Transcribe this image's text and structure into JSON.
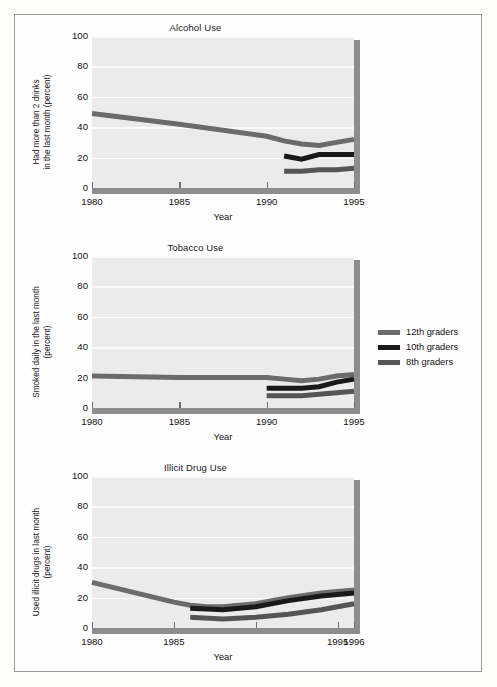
{
  "figure": {
    "xlabel": "Year",
    "legend": {
      "position": "right-middle",
      "entries": [
        {
          "label": "12th graders",
          "color": "#6b6b6b"
        },
        {
          "label": "10th graders",
          "color": "#191919"
        },
        {
          "label": "8th graders",
          "color": "#555555"
        }
      ]
    }
  },
  "chart_data": [
    {
      "type": "line",
      "title": "Alcohol Use",
      "xlabel": "Year",
      "ylabel": "Had more than 2 drinks\nin the last month (percent)",
      "xlim": [
        1980,
        1995
      ],
      "ylim": [
        0,
        100
      ],
      "yticks": [
        0,
        20,
        40,
        60,
        80,
        100
      ],
      "xticks": [
        1980,
        1985,
        1990,
        1995
      ],
      "xtick_labels": [
        "1980",
        "1985",
        "1990",
        "1995"
      ],
      "grid": true,
      "series": [
        {
          "name": "12th graders",
          "color": "#6b6b6b",
          "x": [
            1980,
            1985,
            1990,
            1991,
            1992,
            1993,
            1994,
            1995
          ],
          "values": [
            49,
            42,
            34,
            31,
            29,
            28,
            30,
            32
          ]
        },
        {
          "name": "10th graders",
          "color": "#191919",
          "x": [
            1991,
            1992,
            1993,
            1994,
            1995
          ],
          "values": [
            21,
            19,
            22,
            22,
            22
          ]
        },
        {
          "name": "8th graders",
          "color": "#555555",
          "x": [
            1991,
            1992,
            1993,
            1994,
            1995
          ],
          "values": [
            11,
            11,
            12,
            12,
            13
          ]
        }
      ]
    },
    {
      "type": "line",
      "title": "Tobacco Use",
      "xlabel": "Year",
      "ylabel": "Smoked daily in the last month\n(percent)",
      "xlim": [
        1980,
        1995
      ],
      "ylim": [
        0,
        100
      ],
      "yticks": [
        0,
        20,
        40,
        60,
        80,
        100
      ],
      "xticks": [
        1980,
        1985,
        1990,
        1995
      ],
      "xtick_labels": [
        "1980",
        "1985",
        "1990",
        "1995"
      ],
      "grid": true,
      "series": [
        {
          "name": "12th graders",
          "color": "#6b6b6b",
          "x": [
            1980,
            1985,
            1990,
            1991,
            1992,
            1993,
            1994,
            1995
          ],
          "values": [
            21,
            20,
            20,
            19,
            18,
            19,
            21,
            22
          ]
        },
        {
          "name": "10th graders",
          "color": "#191919",
          "x": [
            1990,
            1991,
            1992,
            1993,
            1994,
            1995
          ],
          "values": [
            13,
            13,
            13,
            14,
            17,
            19
          ]
        },
        {
          "name": "8th graders",
          "color": "#555555",
          "x": [
            1990,
            1991,
            1992,
            1993,
            1994,
            1995
          ],
          "values": [
            8,
            8,
            8,
            9,
            10,
            11
          ]
        }
      ]
    },
    {
      "type": "line",
      "title": "Illicit Drug Use",
      "xlabel": "Year",
      "ylabel": "Used illicit drugs in last month\n(percent)",
      "xlim": [
        1980,
        1996
      ],
      "ylim": [
        0,
        100
      ],
      "yticks": [
        0,
        20,
        40,
        60,
        80,
        100
      ],
      "xticks": [
        1980,
        1985,
        1990,
        1995,
        1996
      ],
      "xtick_labels": [
        "1980",
        "1985",
        "",
        "1995",
        "1996"
      ],
      "grid": true,
      "series": [
        {
          "name": "12th graders",
          "color": "#6b6b6b",
          "x": [
            1980,
            1985,
            1986,
            1987,
            1988,
            1990,
            1992,
            1994,
            1995,
            1996
          ],
          "values": [
            30,
            17,
            15,
            14,
            14,
            16,
            20,
            23,
            24,
            25
          ]
        },
        {
          "name": "10th graders",
          "color": "#191919",
          "x": [
            1986,
            1988,
            1990,
            1992,
            1994,
            1995,
            1996
          ],
          "values": [
            13,
            12,
            14,
            18,
            21,
            22,
            23
          ]
        },
        {
          "name": "8th graders",
          "color": "#555555",
          "x": [
            1986,
            1988,
            1990,
            1992,
            1994,
            1995,
            1996
          ],
          "values": [
            7,
            6,
            7,
            9,
            12,
            14,
            16
          ]
        }
      ]
    }
  ]
}
